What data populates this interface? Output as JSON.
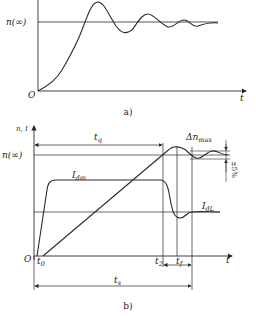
{
  "figure_a": {
    "caption": "a)",
    "origin_label": "O",
    "x_axis_label": "t",
    "reference_label": "n(∞)"
  },
  "figure_b": {
    "caption": "b)",
    "origin_label": "O",
    "y_axis_label": "n, I",
    "x_axis_label": "t",
    "reference_label": "n(∞)",
    "curve_labels": {
      "Idm": "I",
      "Idm_sub": "dm",
      "IdL": "I",
      "IdL_sub": "dL"
    },
    "time_labels": {
      "t0": "t",
      "t0_sub": "0",
      "t2": "t",
      "t2_sub": "2",
      "tf": "t",
      "tf_sub": "f",
      "tq": "t",
      "tq_sub": "q",
      "ts": "t",
      "ts_sub": "s"
    },
    "overshoot_label": "Δn",
    "overshoot_sub": "max",
    "tolerance_label": "±5%"
  },
  "colors": {
    "line": "#2a2a2a",
    "background": "#ffffff"
  }
}
